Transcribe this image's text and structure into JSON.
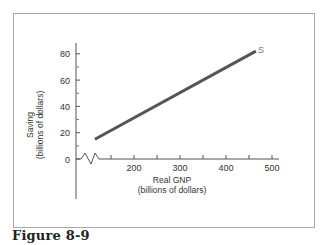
{
  "caption": "Figure 8-9",
  "chart_data": {
    "type": "line",
    "title": "",
    "xlabel": "Real GNP",
    "xlabel_sub": "(billions of dollars)",
    "ylabel": "Saving",
    "ylabel_sub": "(billions of dollars)",
    "x_ticks": [
      200,
      300,
      400,
      500
    ],
    "x_minor_ticks": [
      150,
      250,
      350,
      450
    ],
    "y_ticks": [
      0,
      20,
      40,
      60,
      80
    ],
    "y_minor_ticks": [
      10,
      30,
      50,
      70
    ],
    "xlim": [
      0,
      500
    ],
    "ylim": [
      -30,
      88
    ],
    "x_axis_break": true,
    "grid": false,
    "series": [
      {
        "name": "S",
        "label": "S",
        "color": "#555555",
        "x": [
          115,
          465
        ],
        "y": [
          15,
          82
        ]
      }
    ]
  }
}
